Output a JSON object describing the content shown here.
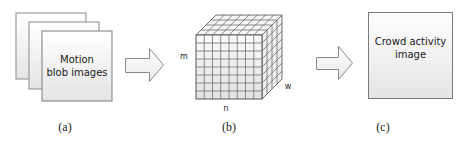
{
  "figure": {
    "panels": [
      {
        "id": "a",
        "caption": "(a)",
        "text_line1": "Motion",
        "text_line2": "blob images",
        "shape": "stacked-sheets",
        "sheet_count": 3
      },
      {
        "id": "b",
        "caption": "(b)",
        "shape": "3d-grid-cube",
        "grid": 8,
        "axis_labels": {
          "height": "m",
          "width": "n",
          "depth": "w"
        }
      },
      {
        "id": "c",
        "caption": "(c)",
        "text_line1": "Crowd activity",
        "text_line2": "image",
        "shape": "single-sheet"
      }
    ],
    "arrows": [
      {
        "from": "a",
        "to": "b"
      },
      {
        "from": "b",
        "to": "c"
      }
    ],
    "colors": {
      "sheet_fill_top": "#ffffff",
      "sheet_fill_bottom": "#e6e6e6",
      "sheet_border": "#7a7a7a",
      "grid_line": "#6e6e6e",
      "arrow_fill": "#f2f2f2",
      "arrow_border": "#8a8a8a"
    }
  }
}
